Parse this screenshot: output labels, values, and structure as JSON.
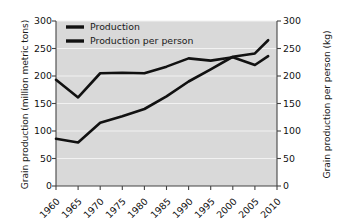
{
  "chart_data": {
    "type": "line",
    "title": "",
    "xlabel": "",
    "ylabel": "Grain production (million metric tons)",
    "y2label": "Grain production per person (kg)",
    "x": [
      1960,
      1965,
      1970,
      1975,
      1980,
      1985,
      1990,
      1995,
      2000,
      2005,
      2008
    ],
    "categories": [
      "1960",
      "1965",
      "1970",
      "1975",
      "1980",
      "1985",
      "1990",
      "1995",
      "2000",
      "2005",
      "2010"
    ],
    "xticks": [
      "1960",
      "1965",
      "1970",
      "1975",
      "1980",
      "1985",
      "1990",
      "1995",
      "2000",
      "2005",
      "2010"
    ],
    "yticks": [
      "0",
      "50",
      "100",
      "150",
      "200",
      "250",
      "300"
    ],
    "y2ticks": [
      "0",
      "50",
      "100",
      "150",
      "200",
      "250",
      "300"
    ],
    "ylim": [
      0,
      300
    ],
    "y2lim": [
      0,
      300
    ],
    "xlim": [
      1960,
      2010
    ],
    "grid": true,
    "grid_color": "#f2f2f2",
    "plot_background": "#d9d9d9",
    "legend_position": "top-left",
    "series": [
      {
        "name": "Production",
        "axis": "left",
        "color": "#111111",
        "values": [
          86,
          79,
          115,
          127,
          140,
          163,
          190,
          212,
          235,
          241,
          265
        ]
      },
      {
        "name": "Production per person",
        "axis": "right",
        "color": "#111111",
        "values": [
          193,
          161,
          205,
          206,
          205,
          217,
          232,
          228,
          234,
          220,
          236
        ]
      }
    ]
  },
  "legend": {
    "items": [
      {
        "label": "Production",
        "color": "#111111"
      },
      {
        "label": "Production per person",
        "color": "#111111"
      }
    ]
  }
}
